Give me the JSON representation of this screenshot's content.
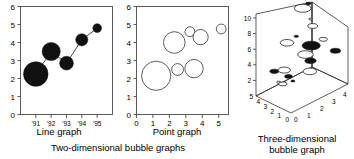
{
  "figure": {
    "background": "#ffffff",
    "ink_color": "#111111",
    "axis_color": "#4a4a4a"
  },
  "captions": {
    "two_dimensional": "Two-dimensional bubble graphs",
    "three_dimensional_line1": "Three-dimensional",
    "three_dimensional_line2": "bubble graph"
  },
  "chart_data": [
    {
      "type": "scatter",
      "id": "line-graph",
      "title": "",
      "xlabel": "Line graph",
      "ylabel": "",
      "style": "bubble-with-connecting-line",
      "marker_fill": "#111111",
      "grid": false,
      "legend": "none",
      "xlim": [
        0,
        6
      ],
      "ylim": [
        0,
        6
      ],
      "x_ticks": [
        "'91",
        "'92",
        "'93",
        "'94",
        "'95"
      ],
      "x_tick_values": [
        1,
        2,
        3,
        4,
        5
      ],
      "y_ticks": [
        "0",
        "1",
        "2",
        "3",
        "4",
        "5",
        "6"
      ],
      "y_tick_values": [
        0,
        1,
        2,
        3,
        4,
        5,
        6
      ],
      "x": [
        1,
        2,
        3,
        4,
        5
      ],
      "y": [
        2.25,
        3.5,
        2.85,
        4.15,
        4.8
      ],
      "sizes": [
        5.0,
        3.7,
        2.8,
        2.5,
        1.8
      ],
      "points": [
        {
          "label": "'91",
          "x": 1,
          "y": 2.25,
          "size": 5.0
        },
        {
          "label": "'92",
          "x": 2,
          "y": 3.5,
          "size": 3.7
        },
        {
          "label": "'93",
          "x": 3,
          "y": 2.85,
          "size": 2.8
        },
        {
          "label": "'94",
          "x": 4,
          "y": 4.15,
          "size": 2.5
        },
        {
          "label": "'95",
          "x": 5,
          "y": 4.8,
          "size": 1.8
        }
      ]
    },
    {
      "type": "scatter",
      "id": "point-graph",
      "title": "",
      "xlabel": "Point graph",
      "ylabel": "",
      "style": "bubble-open",
      "marker_fill": "#ffffff",
      "grid": false,
      "legend": "none",
      "xlim": [
        0,
        5.6
      ],
      "ylim": [
        0,
        6
      ],
      "x_ticks": [
        "0",
        "1",
        "2",
        "3",
        "4",
        "5"
      ],
      "x_tick_values": [
        0,
        1,
        2,
        3,
        4,
        5
      ],
      "y_ticks": [
        "0",
        "1",
        "2",
        "3",
        "4",
        "5",
        "6"
      ],
      "y_tick_values": [
        0,
        1,
        2,
        3,
        4,
        5,
        6
      ],
      "x": [
        1.2,
        2.3,
        2.5,
        3.25,
        3.5,
        3.9,
        5.15
      ],
      "y": [
        2.15,
        4.0,
        2.5,
        4.6,
        2.55,
        4.3,
        4.75
      ],
      "sizes": [
        5.4,
        4.0,
        2.2,
        1.8,
        3.4,
        2.8,
        1.8
      ],
      "points": [
        {
          "x": 1.2,
          "y": 2.15,
          "size": 5.4
        },
        {
          "x": 2.3,
          "y": 4.0,
          "size": 4.0
        },
        {
          "x": 2.5,
          "y": 2.5,
          "size": 2.2
        },
        {
          "x": 3.25,
          "y": 4.6,
          "size": 1.8
        },
        {
          "x": 3.5,
          "y": 2.55,
          "size": 3.4
        },
        {
          "x": 3.9,
          "y": 4.3,
          "size": 2.8
        },
        {
          "x": 5.15,
          "y": 4.75,
          "size": 1.8
        }
      ]
    },
    {
      "type": "scatter",
      "id": "three-dimensional-bubble-graph",
      "title": "",
      "xlabel": "",
      "ylabel": "",
      "zlabel": "",
      "style": "3d-bubble",
      "grid": false,
      "legend": "none",
      "projection": "3d",
      "x_ticks": [
        "0",
        "1",
        "2",
        "3",
        "4"
      ],
      "x_tick_values": [
        0,
        1,
        2,
        3,
        4
      ],
      "y_ticks": [
        "0",
        "1",
        "2",
        "3",
        "4",
        "5"
      ],
      "y_tick_values": [
        0,
        1,
        2,
        3,
        4,
        5
      ],
      "z_ticks": [
        "2",
        "4",
        "6",
        "8",
        "10"
      ],
      "z_tick_values": [
        2,
        4,
        6,
        8,
        10
      ],
      "points": [
        {
          "x": 2.0,
          "y": 2.4,
          "z": 10.0,
          "size": 3.2,
          "filled": false
        },
        {
          "x": 2.3,
          "y": 2.2,
          "z": 10.4,
          "size": 1.0,
          "filled": true
        },
        {
          "x": 1.0,
          "y": 2.6,
          "z": 6.6,
          "size": 2.6,
          "filled": false
        },
        {
          "x": 1.6,
          "y": 2.5,
          "z": 6.9,
          "size": 0.9,
          "filled": true
        },
        {
          "x": 2.6,
          "y": 2.2,
          "z": 7.4,
          "size": 1.9,
          "filled": false
        },
        {
          "x": 2.5,
          "y": 2.3,
          "z": 8.3,
          "size": 0.7,
          "filled": false
        },
        {
          "x": 2.5,
          "y": 2.2,
          "z": 5.1,
          "size": 3.5,
          "filled": true
        },
        {
          "x": 3.3,
          "y": 2.1,
          "z": 5.2,
          "size": 1.6,
          "filled": false
        },
        {
          "x": 2.2,
          "y": 2.4,
          "z": 4.2,
          "size": 3.0,
          "filled": false
        },
        {
          "x": 0.4,
          "y": 3.2,
          "z": 3.4,
          "size": 1.7,
          "filled": true
        },
        {
          "x": 1.0,
          "y": 3.0,
          "z": 3.1,
          "size": 2.4,
          "filled": false
        },
        {
          "x": 2.5,
          "y": 2.3,
          "z": 3.2,
          "size": 2.2,
          "filled": true
        },
        {
          "x": 4.0,
          "y": 1.8,
          "z": 3.3,
          "size": 2.0,
          "filled": true
        },
        {
          "x": 1.4,
          "y": 3.2,
          "z": 1.9,
          "size": 1.5,
          "filled": true
        },
        {
          "x": 2.6,
          "y": 2.6,
          "z": 1.7,
          "size": 2.6,
          "filled": false
        },
        {
          "x": 1.2,
          "y": 3.6,
          "z": 1.0,
          "size": 1.6,
          "filled": false
        },
        {
          "x": 1.0,
          "y": 3.8,
          "z": 1.3,
          "size": 0.8,
          "filled": false
        },
        {
          "x": 1.8,
          "y": 3.4,
          "z": 0.9,
          "size": 0.8,
          "filled": true
        }
      ]
    }
  ]
}
